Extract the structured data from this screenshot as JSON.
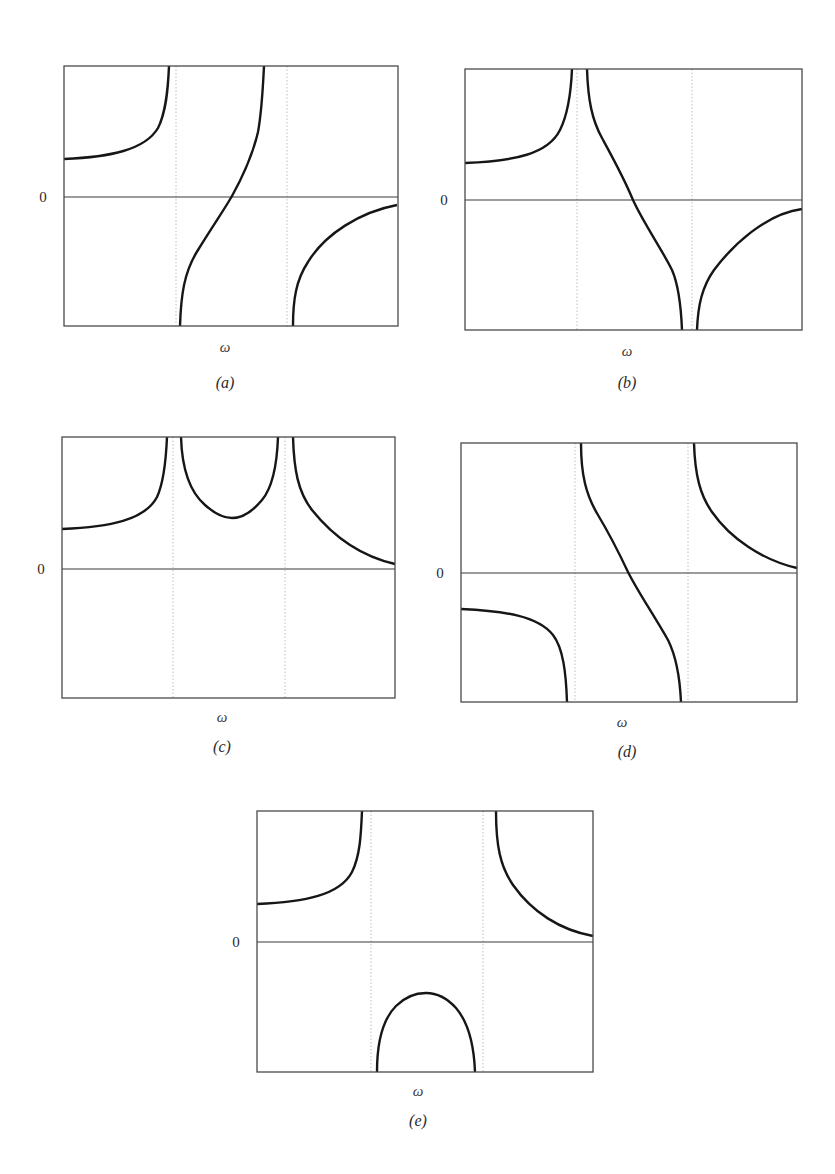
{
  "figure": {
    "y_axis_tick": "0",
    "x_axis_label": "ω",
    "colors": {
      "curve": "#161616",
      "frame": "#4a4a4a",
      "zero_line": "#3a3a3a",
      "asymptote": "#b8b8b8",
      "text": "#2a2a2a"
    }
  },
  "panels": [
    {
      "id": "a",
      "label": "(a)",
      "xlabel": "ω",
      "zero_tick": "0",
      "box": {
        "x": 64,
        "y": 66,
        "w": 334,
        "h": 260
      },
      "zero_y": 197,
      "zero_label_pos": {
        "x": 43,
        "y": 202
      },
      "asymptotes_x": [
        176,
        287
      ],
      "omega_pos": {
        "x": 225,
        "y": 352
      },
      "label_pos": {
        "x": 225,
        "y": 388
      },
      "shape": "left branch rises to +∞ before first marker; middle branch rises from −∞ through zero to +∞; right branch rises from −∞ toward zero",
      "curves": [
        "M64,159 C110,157 145,150 158,128 C166,112 168,90 169,66",
        "M180,326 C181,295 184,272 198,250 C214,224 224,210 232,196 C242,178 252,158 258,132 C262,110 263,85 264,66",
        "M293,326 C293,300 296,280 308,262 C325,234 360,212 397,205"
      ]
    },
    {
      "id": "b",
      "label": "(b)",
      "xlabel": "ω",
      "zero_tick": "0",
      "box": {
        "x": 465,
        "y": 69,
        "w": 337,
        "h": 261
      },
      "zero_y": 200,
      "zero_label_pos": {
        "x": 444,
        "y": 205
      },
      "asymptotes_x": [
        577,
        692
      ],
      "omega_pos": {
        "x": 627,
        "y": 356
      },
      "label_pos": {
        "x": 627,
        "y": 388
      },
      "shape": "left branch rises to +∞; middle branch falls from +∞ through zero to −∞; right branch rises from −∞ toward zero",
      "curves": [
        "M465,163 C515,161 548,154 560,130 C568,114 571,92 572,69",
        "M587,69 C588,100 592,120 602,138 C614,160 624,178 633,200 C644,224 660,246 672,270 C679,286 681,306 682,330",
        "M697,330 C698,305 702,287 714,270 C732,246 765,214 802,209"
      ]
    },
    {
      "id": "c",
      "label": "(c)",
      "xlabel": "ω",
      "zero_tick": "0",
      "box": {
        "x": 62,
        "y": 437,
        "w": 333,
        "h": 261
      },
      "zero_y": 569,
      "zero_label_pos": {
        "x": 41,
        "y": 574
      },
      "asymptotes_x": [
        173,
        285
      ],
      "omega_pos": {
        "x": 222,
        "y": 722
      },
      "label_pos": {
        "x": 222,
        "y": 752
      },
      "shape": "left branch rises to +∞; middle U-shaped branch between the two markers with positive minimum; right branch falls from +∞ toward zero (all positive)",
      "curves": [
        "M62,529 C110,527 145,520 157,497 C164,482 166,460 167,437",
        "M181,437 C182,470 190,492 205,505 C215,514 224,518 232,518 C242,518 252,512 262,500 C272,488 277,465 278,437",
        "M293,437 C294,470 298,492 312,510 C332,535 360,556 395,564"
      ]
    },
    {
      "id": "d",
      "label": "(d)",
      "xlabel": "ω",
      "zero_tick": "0",
      "box": {
        "x": 461,
        "y": 443,
        "w": 336,
        "h": 259
      },
      "zero_y": 573,
      "zero_label_pos": {
        "x": 440,
        "y": 578
      },
      "asymptotes_x": [
        575,
        688
      ],
      "omega_pos": {
        "x": 622,
        "y": 727
      },
      "label_pos": {
        "x": 627,
        "y": 757
      },
      "shape": "left branch negative, falls to −∞; middle branch falls from +∞ through zero to −∞; right branch falls from +∞ toward zero",
      "curves": [
        "M461,609 C505,611 538,616 553,635 C563,648 566,672 567,702",
        "M581,443 C581,475 586,495 598,515 C610,535 620,555 628,572 C638,592 652,612 668,640 C677,658 680,680 681,702",
        "M694,443 C695,475 700,495 712,512 C730,538 762,560 797,568"
      ]
    },
    {
      "id": "e",
      "label": "(e)",
      "xlabel": "ω",
      "zero_tick": "0",
      "box": {
        "x": 257,
        "y": 811,
        "w": 336,
        "h": 261
      },
      "zero_y": 942,
      "zero_label_pos": {
        "x": 236,
        "y": 947
      },
      "asymptotes_x": [
        371,
        483
      ],
      "omega_pos": {
        "x": 418,
        "y": 1096
      },
      "label_pos": {
        "x": 418,
        "y": 1126
      },
      "shape": "left branch rises to +∞; middle dome-shaped branch entirely negative between markers (peak below zero); right branch falls from +∞ toward zero",
      "curves": [
        "M257,904 C305,902 340,895 352,872 C360,856 361,835 362,811",
        "M377,1072 C377,1040 384,1018 396,1006 C406,996 415,993 426,993 C438,993 447,998 456,1008 C468,1022 474,1045 475,1072",
        "M496,811 C496,845 500,866 513,885 C532,912 560,930 593,936"
      ]
    }
  ]
}
